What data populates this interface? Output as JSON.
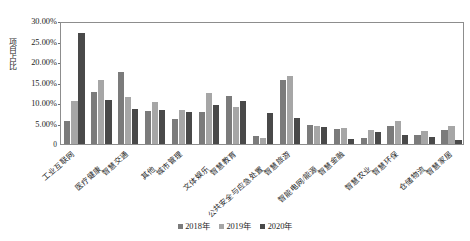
{
  "chart_data": {
    "type": "bar",
    "title": "",
    "xlabel": "",
    "ylabel": "项目占比",
    "ylim": [
      0,
      30
    ],
    "yunit": "%",
    "grid": false,
    "legend_position": "bottom",
    "ytick_labels": [
      "0",
      "5.00%",
      "10.00%",
      "15.00%",
      "20.00%",
      "25.00%",
      "30.00%"
    ],
    "ytick_values": [
      0,
      5,
      10,
      15,
      20,
      25,
      30
    ],
    "categories": [
      "工业互联网",
      "医疗健康",
      "智慧交通",
      "其他",
      "城市管理",
      "文体娱乐",
      "智慧教育",
      "公共安全与应急处置",
      "智慧旅游",
      "智能电网/能源",
      "智慧金融",
      "智慧农业",
      "智慧环保",
      "仓储物流",
      "智慧家居"
    ],
    "series": [
      {
        "name": "2018年",
        "color": "#7b7b7b",
        "values": [
          5.6,
          12.8,
          17.6,
          8.0,
          6.2,
          7.8,
          11.6,
          2.0,
          15.5,
          4.6,
          3.6,
          1.4,
          4.3,
          2.2,
          3.4
        ]
      },
      {
        "name": "2019年",
        "color": "#a6a6a6",
        "values": [
          10.5,
          15.5,
          11.5,
          10.2,
          8.3,
          12.4,
          9.0,
          1.5,
          16.7,
          4.4,
          4.0,
          3.5,
          5.6,
          3.1,
          4.3
        ]
      },
      {
        "name": "2020年",
        "color": "#494949",
        "values": [
          27.0,
          10.7,
          8.6,
          8.2,
          7.7,
          9.4,
          10.5,
          7.6,
          6.3,
          4.2,
          1.2,
          3.0,
          2.3,
          1.6,
          0.9
        ]
      }
    ]
  },
  "legend": {
    "entries": [
      "2018年",
      "2019年",
      "2020年"
    ]
  }
}
